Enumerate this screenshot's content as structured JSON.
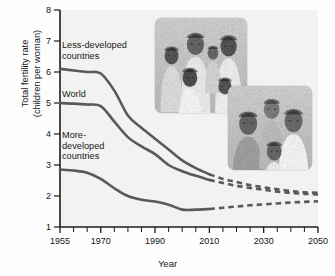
{
  "chart_data": {
    "type": "line",
    "title": "",
    "xlabel": "Year",
    "ylabel": "Total fertility rate (children per woman)",
    "ylabel_line1": "Total fertility rate",
    "ylabel_line2": "(children per woman)",
    "xlim": [
      1955,
      2050
    ],
    "ylim": [
      1,
      8
    ],
    "yticks": [
      1,
      2,
      3,
      4,
      5,
      6,
      7,
      8
    ],
    "ytick_labels": [
      "1",
      "2",
      "3",
      "4",
      "5",
      "6",
      "7",
      "8"
    ],
    "xticks_major": [
      1955,
      1970,
      1990,
      2010,
      2030,
      2050
    ],
    "xtick_labels": [
      "1955",
      "1970",
      "1990",
      "2010",
      "2030",
      "2050"
    ],
    "xticks_minor": [
      1960,
      1965,
      1975,
      1980,
      1985,
      1995,
      2000,
      2005,
      2015,
      2020,
      2025,
      2035,
      2040,
      2045
    ],
    "grid": false,
    "legend": "inline-annotations",
    "projection_start_year": 2010,
    "line_color": "#595959",
    "series": [
      {
        "name": "Less-developed countries",
        "label_lines": "Less-developed\ncountries",
        "label_x": 62,
        "label_y": 40,
        "x": [
          1955,
          1960,
          1965,
          1970,
          1975,
          1980,
          1985,
          1990,
          1995,
          2000,
          2005,
          2010,
          2015,
          2020,
          2025,
          2030,
          2035,
          2040,
          2045,
          2050
        ],
        "values": [
          6.1,
          6.05,
          6.0,
          5.95,
          5.4,
          4.6,
          4.2,
          3.85,
          3.5,
          3.15,
          2.9,
          2.7,
          2.55,
          2.45,
          2.35,
          2.28,
          2.22,
          2.16,
          2.12,
          2.1
        ]
      },
      {
        "name": "World",
        "label_lines": "World",
        "label_x": 62,
        "label_y": 89,
        "x": [
          1955,
          1960,
          1965,
          1970,
          1975,
          1980,
          1985,
          1990,
          1995,
          2000,
          2005,
          2010,
          2015,
          2020,
          2025,
          2030,
          2035,
          2040,
          2045,
          2050
        ],
        "values": [
          5.0,
          4.98,
          4.95,
          4.9,
          4.4,
          3.9,
          3.6,
          3.35,
          3.0,
          2.8,
          2.65,
          2.52,
          2.42,
          2.33,
          2.26,
          2.2,
          2.14,
          2.1,
          2.07,
          2.05
        ]
      },
      {
        "name": "More-developed countries",
        "label_lines": "More-\ndeveloped\ncountries",
        "label_x": 62,
        "label_y": 130,
        "x": [
          1955,
          1960,
          1965,
          1970,
          1975,
          1980,
          1985,
          1990,
          1995,
          2000,
          2005,
          2010,
          2015,
          2020,
          2025,
          2030,
          2035,
          2040,
          2045,
          2050
        ],
        "values": [
          2.85,
          2.82,
          2.75,
          2.55,
          2.25,
          2.0,
          1.88,
          1.82,
          1.72,
          1.56,
          1.56,
          1.58,
          1.62,
          1.66,
          1.7,
          1.73,
          1.76,
          1.79,
          1.81,
          1.83
        ]
      }
    ],
    "photos": [
      {
        "name": "large-family-photo",
        "caption": "Photograph of a large family from a less-developed country",
        "x": 155,
        "y": 18,
        "width": 92,
        "height": 95
      },
      {
        "name": "small-family-photo",
        "caption": "Photograph of a small family from a more-developed country",
        "x": 228,
        "y": 86,
        "width": 84,
        "height": 84
      }
    ]
  }
}
